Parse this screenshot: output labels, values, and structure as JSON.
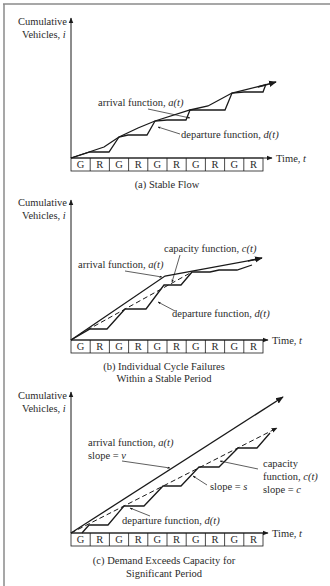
{
  "figure": {
    "panels": [
      {
        "id": "a",
        "y_axis_label": [
          "Cumulative",
          "Vehicles, i"
        ],
        "x_axis_label": "Time, t",
        "signal_phases": [
          "G",
          "R",
          "G",
          "R",
          "G",
          "R",
          "G",
          "R",
          "G",
          "R"
        ],
        "annotations": [
          {
            "text": "arrival function, a(t)"
          },
          {
            "text": "departure function, d(t)"
          }
        ],
        "caption": [
          "(a)  Stable Flow"
        ]
      },
      {
        "id": "b",
        "y_axis_label": [
          "Cumulative",
          "Vehicles, i"
        ],
        "x_axis_label": "Time, t",
        "signal_phases": [
          "G",
          "R",
          "G",
          "R",
          "G",
          "R",
          "G",
          "R",
          "G",
          "R"
        ],
        "annotations": [
          {
            "text": "capacity function, c(t)"
          },
          {
            "text": "arrival function, a(t)"
          },
          {
            "text": "departure function, d(t)"
          }
        ],
        "caption": [
          "(b) Individual Cycle Failures",
          "Within a Stable Period"
        ]
      },
      {
        "id": "c",
        "y_axis_label": [
          "Cumulative",
          "Vehicles, i"
        ],
        "x_axis_label": "Time, t",
        "signal_phases": [
          "G",
          "R",
          "G",
          "R",
          "G",
          "R",
          "G",
          "R",
          "G",
          "R"
        ],
        "annotations": [
          {
            "text": "arrival function, a(t)"
          },
          {
            "text": "slope = v"
          },
          {
            "text": "capacity"
          },
          {
            "text": "function, c(t)"
          },
          {
            "text": "slope = c"
          },
          {
            "text": "slope = s"
          },
          {
            "text": "departure function, d(t)"
          }
        ],
        "caption": [
          "(c) Demand Exceeds Capacity for",
          "Significant Period"
        ]
      }
    ]
  },
  "colors": {
    "ink": "#1a1a1a",
    "frame": "#8a8a8a",
    "background": "#ffffff"
  }
}
